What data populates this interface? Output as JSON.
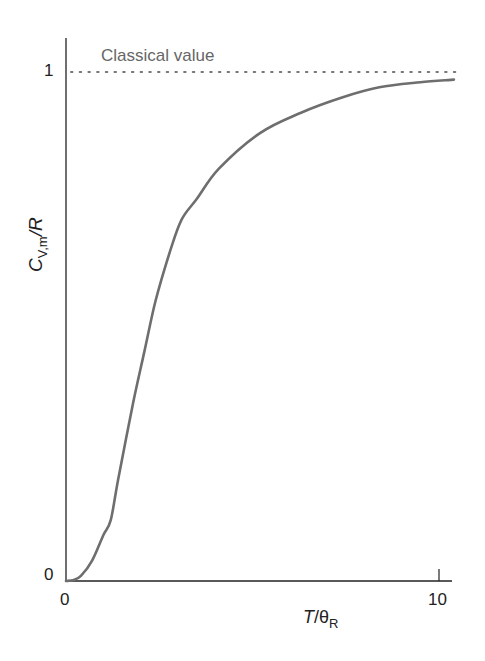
{
  "chart_data": {
    "type": "line",
    "title": "",
    "xlabel": "T/θ_R",
    "ylabel": "C_V,m/R",
    "xlim": [
      0,
      10.4
    ],
    "ylim": [
      0,
      1.07
    ],
    "xticks": [
      "0",
      "10"
    ],
    "yticks": [
      "0",
      "1"
    ],
    "grid": false,
    "annotations": [
      {
        "text": "Classical value",
        "y": 1,
        "style": "dotted horizontal line"
      }
    ],
    "series": [
      {
        "name": "C_V,m/R",
        "x": [
          0,
          0.2,
          0.4,
          0.7,
          1.0,
          1.2,
          1.4,
          1.8,
          2.1,
          2.4,
          2.8,
          3.1,
          3.5,
          4.1,
          5.2,
          6.3,
          7.4,
          8.4,
          9.5,
          10.4
        ],
        "values": [
          0,
          0.002,
          0.01,
          0.04,
          0.09,
          0.12,
          0.2,
          0.35,
          0.45,
          0.55,
          0.65,
          0.71,
          0.75,
          0.81,
          0.88,
          0.92,
          0.95,
          0.97,
          0.98,
          0.985
        ]
      }
    ],
    "colors": {
      "axis": "#222222",
      "curve": "#6e6e6e",
      "classical_line": "#777777",
      "annotation_text": "#666666"
    }
  },
  "labels": {
    "classical": "Classical value",
    "y_tick_0": "0",
    "y_tick_1": "1",
    "x_tick_0": "0",
    "x_tick_10": "10",
    "ylabel_main": "C",
    "ylabel_sub": "V,m",
    "ylabel_tail": "/R",
    "xlabel_main": "T",
    "xlabel_mid": "/θ",
    "xlabel_sub": "R"
  }
}
